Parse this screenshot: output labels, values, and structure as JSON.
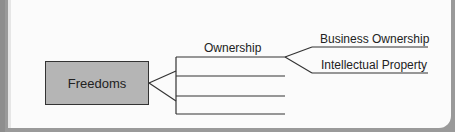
{
  "diagram": {
    "root": {
      "label": "Freedoms"
    },
    "branches": [
      {
        "label": "Ownership",
        "children": [
          {
            "label": "Business Ownership"
          },
          {
            "label": "Intellectual Property"
          }
        ]
      },
      {
        "label": ""
      },
      {
        "label": ""
      },
      {
        "label": ""
      }
    ]
  },
  "colors": {
    "root_fill": "#b5b5b5",
    "line": "#333333",
    "background": "#fbfbfb"
  }
}
